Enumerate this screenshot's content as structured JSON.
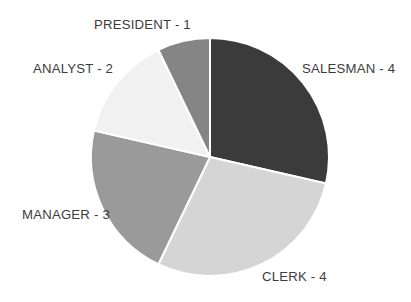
{
  "chart_data": {
    "type": "pie",
    "title": "",
    "xlabel": "",
    "ylabel": "",
    "categories": [
      "SALESMAN",
      "CLERK",
      "MANAGER",
      "ANALYST",
      "PRESIDENT"
    ],
    "values": [
      4,
      4,
      3,
      2,
      1
    ],
    "total": 14,
    "legend_position": "none",
    "grid": false,
    "start_angle_deg": 0,
    "direction": "clockwise",
    "slices": [
      {
        "label": "SALESMAN - 4",
        "name": "SALESMAN",
        "value": 4,
        "percent": 28.6,
        "color": "#3b3b3b",
        "start_deg": 0,
        "end_deg": 102.9
      },
      {
        "label": "CLERK - 4",
        "name": "CLERK",
        "value": 4,
        "percent": 28.6,
        "color": "#d5d5d5",
        "start_deg": 102.9,
        "end_deg": 205.7
      },
      {
        "label": "MANAGER - 3",
        "name": "MANAGER",
        "value": 3,
        "percent": 21.4,
        "color": "#9a9a9a",
        "start_deg": 205.7,
        "end_deg": 282.9
      },
      {
        "label": "ANALYST - 2",
        "name": "ANALYST",
        "value": 2,
        "percent": 14.3,
        "color": "#f1f1f1",
        "start_deg": 282.9,
        "end_deg": 334.3
      },
      {
        "label": "PRESIDENT - 1",
        "name": "PRESIDENT",
        "value": 1,
        "percent": 7.1,
        "color": "#858585",
        "start_deg": 334.3,
        "end_deg": 360
      }
    ],
    "geometry": {
      "center_x": 210,
      "center_y": 157,
      "radius": 119,
      "separator_color": "#ffffff",
      "separator_width": 2
    },
    "background_color": "#ffffff",
    "label_color": "#3c3c3c"
  },
  "labels": {
    "president": "PRESIDENT - 1",
    "salesman": "SALESMAN - 4",
    "analyst": "ANALYST - 2",
    "manager": "MANAGER - 3",
    "clerk": "CLERK - 4"
  }
}
